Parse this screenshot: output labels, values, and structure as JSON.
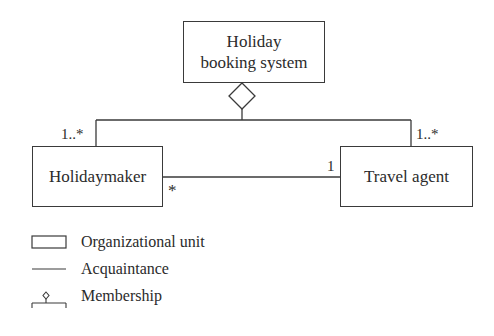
{
  "diagram": {
    "nodes": {
      "system": {
        "line1": "Holiday",
        "line2": "booking system"
      },
      "holidaymaker": {
        "label": "Holidaymaker"
      },
      "travel_agent": {
        "label": "Travel agent"
      }
    },
    "multiplicities": {
      "holidaymaker_membership": "1..*",
      "travel_agent_membership": "1..*",
      "holidaymaker_acquaintance": "*",
      "travel_agent_acquaintance": "1"
    },
    "relations": [
      {
        "type": "membership",
        "from": "Holidaymaker",
        "to": "Holiday booking system"
      },
      {
        "type": "membership",
        "from": "Travel agent",
        "to": "Holiday booking system"
      },
      {
        "type": "acquaintance",
        "from": "Holidaymaker",
        "to": "Travel agent"
      }
    ],
    "colors": {
      "stroke": "#3a3a3a",
      "text": "#2b2b2b",
      "background": "#ffffff"
    }
  },
  "legend": {
    "items": [
      {
        "icon": "rectangle-icon",
        "label": "Organizational unit"
      },
      {
        "icon": "line-icon",
        "label": "Acquaintance"
      },
      {
        "icon": "membership-diamond-icon",
        "label": "Membership"
      }
    ]
  }
}
